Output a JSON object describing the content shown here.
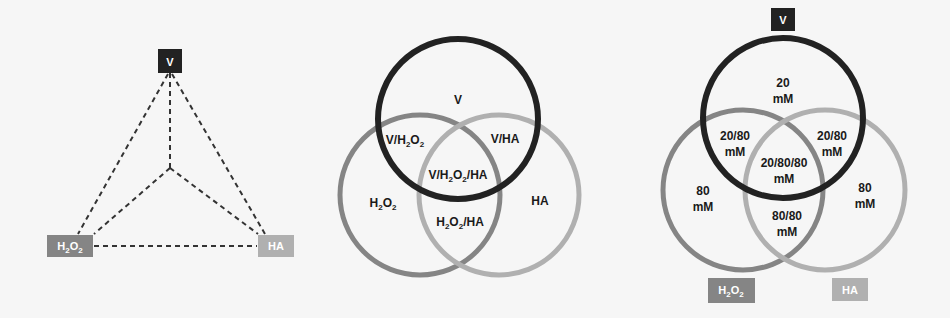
{
  "colors": {
    "background": "#f6f6f6",
    "v": "#222222",
    "h2o2": "#858585",
    "ha": "#b0b0b0",
    "label_text": "#1a1a1a",
    "dash_line": "#333333"
  },
  "triangle": {
    "nodes": {
      "v": {
        "base": "V"
      },
      "h2o2": {
        "base_h": "H",
        "sub1": "2",
        "base_o": "O",
        "sub2": "2"
      },
      "ha": {
        "base": "HA"
      }
    }
  },
  "venn_labels": {
    "v": "V",
    "v_h2o2": {
      "a": "V/H",
      "s1": "2",
      "b": "O",
      "s2": "2"
    },
    "v_ha": "V/HA",
    "v_h2o2_ha": {
      "a": "V/H",
      "s1": "2",
      "b": "O",
      "s2": "2",
      "c": "/HA"
    },
    "h2o2": {
      "a": "H",
      "s1": "2",
      "b": "O",
      "s2": "2"
    },
    "h2o2_ha": {
      "a": "H",
      "s1": "2",
      "b": "O",
      "s2": "2",
      "c": "/HA"
    },
    "ha": "HA"
  },
  "concentration_venn": {
    "v_box": "V",
    "h2o2_box": {
      "a": "H",
      "s1": "2",
      "b": "O",
      "s2": "2"
    },
    "ha_box": "HA",
    "unit": "mM",
    "regions": {
      "v_only": "20",
      "v_h2o2": "20/80",
      "v_ha": "20/80",
      "v_h2o2_ha": "20/80/80",
      "h2o2_only": "80",
      "ha_only": "80",
      "h2o2_ha": "80/80"
    }
  }
}
